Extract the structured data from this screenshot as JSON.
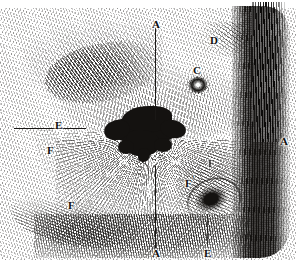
{
  "figure": {
    "kind": "engraving-plate",
    "background_color": "#ffffff",
    "ink_color": "#141210",
    "width": 296,
    "height": 268
  },
  "labels": [
    {
      "id": "a-top",
      "text": "A",
      "x": 152,
      "y": 19,
      "name": "label-a-top"
    },
    {
      "id": "d",
      "text": "D",
      "x": 210,
      "y": 35,
      "name": "label-d"
    },
    {
      "id": "c",
      "text": "C",
      "x": 193,
      "y": 65,
      "name": "label-c"
    },
    {
      "id": "e-left",
      "text": "E",
      "x": 55,
      "y": 120,
      "name": "label-e-left"
    },
    {
      "id": "a-right",
      "text": "A",
      "x": 280,
      "y": 136,
      "name": "label-a-right"
    },
    {
      "id": "f-upper",
      "text": "F",
      "x": 47,
      "y": 145,
      "name": "label-f-upper-left"
    },
    {
      "id": "f-right",
      "text": "F",
      "x": 208,
      "y": 158,
      "name": "label-f-right"
    },
    {
      "id": "f-prime",
      "text": "F",
      "prime": "'",
      "x": 185,
      "y": 175,
      "name": "label-f-prime"
    },
    {
      "id": "f-lower",
      "text": "F",
      "x": 68,
      "y": 200,
      "name": "label-f-lower-left"
    },
    {
      "id": "a-bottom",
      "text": "A",
      "x": 152,
      "y": 248,
      "name": "label-a-bottom"
    },
    {
      "id": "e-bottom",
      "text": "E",
      "x": 204,
      "y": 248,
      "name": "label-e-bottom"
    }
  ],
  "leaders": [
    {
      "id": "a-vertical-upper",
      "orientation": "vertical",
      "x": 155,
      "y": 28,
      "length": 92,
      "name": "leader-a-upper"
    },
    {
      "id": "a-vertical-lower",
      "orientation": "vertical",
      "x": 155,
      "y": 166,
      "length": 82,
      "name": "leader-a-lower"
    },
    {
      "id": "e-horizontal",
      "orientation": "horizontal",
      "x": 14,
      "y": 128,
      "length": 72,
      "name": "leader-e-horizontal"
    },
    {
      "id": "e-vertical-bottom",
      "orientation": "vertical",
      "x": 207,
      "y": 214,
      "length": 32,
      "name": "leader-e-bottom"
    }
  ]
}
